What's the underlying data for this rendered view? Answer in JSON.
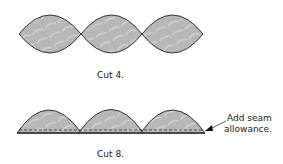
{
  "top": {
    "caption": "Cut 4.",
    "pieces": 3,
    "shape": "pointed-oval"
  },
  "bottom": {
    "caption": "Cut 8.",
    "pieces": 3,
    "shape": "half-oval-arch",
    "annotation_line1": "Add seam",
    "annotation_line2": "allowance."
  },
  "colors": {
    "fill": "#b8b8b8",
    "stroke": "#333333",
    "pattern": "#d4d4d4"
  }
}
